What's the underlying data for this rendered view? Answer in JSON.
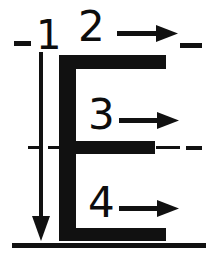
{
  "diagram": {
    "ink_color": "#0d0d0d",
    "background_color": "#ffffff",
    "width": 214,
    "height": 260,
    "glyph": {
      "name": "E-shape glyph",
      "description": "Thick vertical stem at left joined by three thick horizontal bars"
    },
    "stroke_labels": [
      {
        "id": "1",
        "text": "1",
        "direction": "down",
        "note": "vertical stem, drawn top to bottom"
      },
      {
        "id": "2",
        "text": "2",
        "direction": "right",
        "note": "upper horizontal bar, drawn left to right"
      },
      {
        "id": "3",
        "text": "3",
        "direction": "right",
        "note": "middle horizontal bar, drawn left to right"
      },
      {
        "id": "4",
        "text": "4",
        "direction": "right",
        "note": "lower horizontal bar, drawn left to right"
      }
    ],
    "guides": [
      {
        "id": "top-centerline",
        "style": "dash",
        "orientation": "horizontal",
        "note": "short dashes flanking the number 1 row"
      },
      {
        "id": "middle-centerline",
        "style": "dash-dot",
        "orientation": "horizontal",
        "note": "centerline through the middle bar"
      },
      {
        "id": "baseline",
        "style": "solid",
        "orientation": "horizontal",
        "note": "thin ground line under the glyph"
      }
    ]
  }
}
